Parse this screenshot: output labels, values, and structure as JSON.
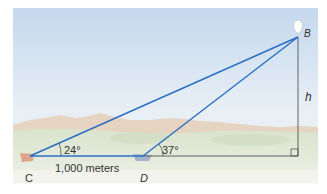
{
  "diagram": {
    "points": {
      "B": {
        "label": "B"
      },
      "C": {
        "label": "C"
      },
      "D": {
        "label": "D"
      }
    },
    "angles": {
      "C": "24°",
      "D": "37°"
    },
    "distance_CD": "1,000 meters",
    "height_label": "h",
    "colors": {
      "line": "#2a6fc4",
      "height_line": "#555555",
      "sky_top": "#c9dcef",
      "sky_bottom": "#eef3f6",
      "mountains": "#e2c7ae",
      "ground": "#dfe7d3"
    }
  }
}
